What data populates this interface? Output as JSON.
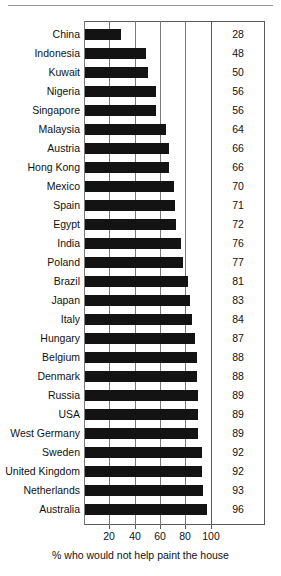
{
  "chart_data": {
    "type": "bar",
    "orientation": "horizontal",
    "title": "",
    "xlabel": "% who would not help paint the house",
    "ylabel": "",
    "xlim": [
      0,
      113
    ],
    "xticks": [
      20,
      40,
      60,
      80,
      100
    ],
    "gridlines": [
      0,
      20,
      40,
      60,
      80,
      100
    ],
    "grid": true,
    "legend": "none",
    "value_labels_shown": true,
    "bar_color": "#131313",
    "categories": [
      "China",
      "Indonesia",
      "Kuwait",
      "Nigeria",
      "Singapore",
      "Malaysia",
      "Austria",
      "Hong Kong",
      "Mexico",
      "Spain",
      "Egypt",
      "India",
      "Poland",
      "Brazil",
      "Japan",
      "Italy",
      "Hungary",
      "Belgium",
      "Denmark",
      "Russia",
      "USA",
      "West Germany",
      "Sweden",
      "United Kingdom",
      "Netherlands",
      "Australia"
    ],
    "values": [
      28,
      48,
      50,
      56,
      56,
      64,
      66,
      66,
      70,
      71,
      72,
      76,
      77,
      81,
      83,
      84,
      87,
      88,
      88,
      89,
      89,
      89,
      92,
      92,
      93,
      96
    ]
  },
  "axis": {
    "caption": "% who would not help paint the house",
    "tick_labels": [
      "20",
      "40",
      "60",
      "80",
      "100"
    ]
  },
  "colors": {
    "bar": "#131313",
    "frame": "#5a5a5a",
    "grid": "#7a7a7a",
    "rule": "#999999",
    "text": "#111111"
  }
}
